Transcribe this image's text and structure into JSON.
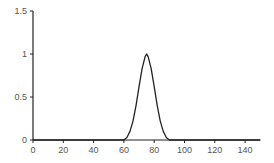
{
  "chart_data": {
    "type": "line",
    "title": "",
    "xlabel": "",
    "ylabel": "",
    "xlim": [
      0,
      150
    ],
    "ylim": [
      0,
      1.5
    ],
    "grid": false,
    "legend": null,
    "x_ticks": [
      0,
      20,
      40,
      60,
      80,
      100,
      120,
      140
    ],
    "x_tick_labels": [
      "0",
      "20",
      "40",
      "60",
      "80",
      "100",
      "120",
      "140"
    ],
    "y_ticks": [
      0,
      0.5,
      1,
      1.5
    ],
    "y_tick_labels": [
      "0",
      "0.5",
      "1",
      "1.5"
    ],
    "series": [
      {
        "name": "pulse",
        "color": "#222222",
        "x": [
          0,
          60,
          62,
          64,
          66,
          68,
          70,
          72,
          74,
          75,
          76,
          78,
          80,
          82,
          84,
          86,
          88,
          90,
          150
        ],
        "y": [
          0,
          0,
          0.03,
          0.1,
          0.22,
          0.4,
          0.62,
          0.83,
          0.97,
          1.0,
          0.97,
          0.83,
          0.62,
          0.4,
          0.22,
          0.1,
          0.03,
          0,
          0
        ]
      }
    ]
  },
  "colors": {
    "axis": "#222222",
    "line": "#222222",
    "label": "#555555",
    "background": "#ffffff"
  }
}
